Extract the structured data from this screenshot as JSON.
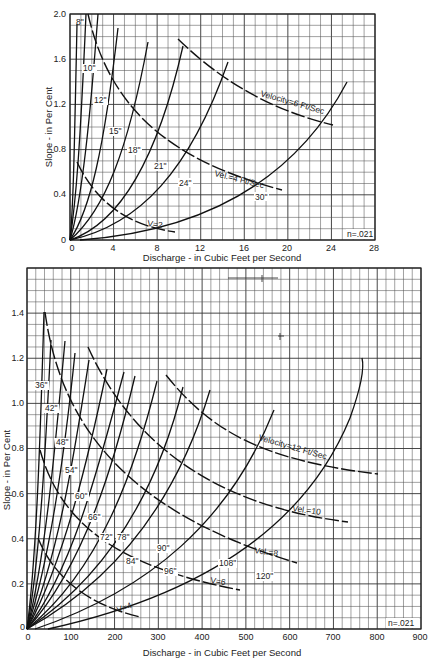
{
  "chart_data": [
    {
      "type": "line",
      "title": "",
      "xlabel": "Discharge - in Cubic Feet per Second",
      "ylabel": "Slope - in Per Cent",
      "xlim": [
        0,
        28
      ],
      "ylim": [
        0,
        2.0
      ],
      "x_ticks": [
        "0",
        "4",
        "8",
        "12",
        "16",
        "20",
        "24",
        "28"
      ],
      "y_ticks": [
        "0",
        "0.4",
        "0.8",
        "1.2",
        "1.6",
        "2.0"
      ],
      "grid": true,
      "annotation": "n=.021",
      "pipe_size_series": [
        {
          "name": "8\"",
          "points": [
            [
              0,
              0
            ],
            [
              0.3,
              0.3
            ],
            [
              0.45,
              0.8
            ],
            [
              0.6,
              1.9
            ]
          ]
        },
        {
          "name": "10\"",
          "points": [
            [
              0,
              0
            ],
            [
              0.5,
              0.3
            ],
            [
              0.9,
              0.8
            ],
            [
              1.2,
              1.3
            ],
            [
              1.4,
              1.7
            ],
            [
              1.5,
              2.0
            ]
          ]
        },
        {
          "name": "12\"",
          "points": [
            [
              0,
              0
            ],
            [
              0.9,
              0.3
            ],
            [
              1.6,
              0.8
            ],
            [
              2.2,
              1.4
            ],
            [
              2.6,
              2.0
            ]
          ]
        },
        {
          "name": "15\"",
          "points": [
            [
              0,
              0
            ],
            [
              1.5,
              0.25
            ],
            [
              2.8,
              0.7
            ],
            [
              3.6,
              1.1
            ],
            [
              4.4,
              1.85
            ]
          ]
        },
        {
          "name": "18\"",
          "points": [
            [
              0,
              0
            ],
            [
              2.5,
              0.25
            ],
            [
              4.6,
              0.7
            ],
            [
              6.0,
              1.2
            ],
            [
              7.2,
              1.75
            ]
          ]
        },
        {
          "name": "21\"",
          "points": [
            [
              0,
              0
            ],
            [
              3.7,
              0.22
            ],
            [
              6.9,
              0.6
            ],
            [
              8.8,
              1.0
            ],
            [
              10.4,
              1.7
            ]
          ]
        },
        {
          "name": "24\"",
          "points": [
            [
              0,
              0
            ],
            [
              5.5,
              0.2
            ],
            [
              9.5,
              0.5
            ],
            [
              12.3,
              0.9
            ],
            [
              13.5,
              1.2
            ],
            [
              14.5,
              1.6
            ]
          ]
        },
        {
          "name": "30\"",
          "points": [
            [
              1.0,
              0
            ],
            [
              8,
              0.06
            ],
            [
              14,
              0.2
            ],
            [
              19,
              0.45
            ],
            [
              22.5,
              0.8
            ],
            [
              24.5,
              1.1
            ],
            [
              25.5,
              1.35
            ]
          ]
        }
      ],
      "velocity_series": [
        {
          "name": "V=2",
          "points": [
            [
              0.6,
              0.7
            ],
            [
              2.5,
              0.33
            ],
            [
              5,
              0.18
            ],
            [
              7.5,
              0.1
            ],
            [
              9.6,
              0.07
            ]
          ]
        },
        {
          "name": "Vel.=4 Ft/Sec",
          "points": [
            [
              1.5,
              2.0
            ],
            [
              3,
              1.4
            ],
            [
              5,
              1.0
            ],
            [
              8,
              0.75
            ],
            [
              11,
              0.6
            ],
            [
              14,
              0.52
            ],
            [
              17,
              0.46
            ],
            [
              19.5,
              0.44
            ]
          ]
        },
        {
          "name": "Velocity=6 Ft/Sec",
          "points": [
            [
              10,
              1.78
            ],
            [
              13,
              1.48
            ],
            [
              16,
              1.3
            ],
            [
              19,
              1.17
            ],
            [
              22,
              1.08
            ],
            [
              24.2,
              1.02
            ]
          ]
        }
      ]
    },
    {
      "type": "line",
      "title": "",
      "xlabel": "Discharge - in Cubic Feet per Second",
      "ylabel": "Slope - in Per Cent",
      "xlim": [
        0,
        900
      ],
      "ylim": [
        0,
        1.6
      ],
      "x_ticks": [
        "0",
        "100",
        "200",
        "300",
        "400",
        "500",
        "600",
        "700",
        "800",
        "900"
      ],
      "y_ticks": [
        "0",
        "0.2",
        "0.4",
        "0.6",
        "0.8",
        "1.0",
        "1.2",
        "1.4"
      ],
      "grid": true,
      "annotation": "n=.021",
      "pipe_size_series": [
        {
          "name": "36\"",
          "points": [
            [
              0,
              0
            ],
            [
              22,
              0.3
            ],
            [
              32,
              0.8
            ],
            [
              38,
              1.4
            ]
          ]
        },
        {
          "name": "42\"",
          "points": [
            [
              0,
              0
            ],
            [
              30,
              0.3
            ],
            [
              48,
              0.8
            ],
            [
              56,
              1.32
            ]
          ]
        },
        {
          "name": "48\"",
          "points": [
            [
              0,
              0
            ],
            [
              45,
              0.3
            ],
            [
              68,
              0.8
            ],
            [
              80,
              1.3
            ]
          ]
        },
        {
          "name": "54\"",
          "points": [
            [
              0,
              0
            ],
            [
              60,
              0.3
            ],
            [
              88,
              0.8
            ],
            [
              104,
              1.22
            ]
          ]
        },
        {
          "name": "60\"",
          "points": [
            [
              0,
              0
            ],
            [
              80,
              0.3
            ],
            [
              115,
              0.8
            ],
            [
              134,
              1.2
            ]
          ]
        },
        {
          "name": "66\"",
          "points": [
            [
              0,
              0
            ],
            [
              100,
              0.3
            ],
            [
              140,
              0.75
            ],
            [
              165,
              1.15
            ]
          ]
        },
        {
          "name": "72\"",
          "points": [
            [
              0,
              0
            ],
            [
              125,
              0.3
            ],
            [
              175,
              0.75
            ],
            [
              205,
              1.13
            ]
          ]
        },
        {
          "name": "78\"",
          "points": [
            [
              0,
              0
            ],
            [
              150,
              0.3
            ],
            [
              210,
              0.72
            ],
            [
              245,
              1.1
            ]
          ]
        },
        {
          "name": "84\"",
          "points": [
            [
              0,
              0
            ],
            [
              180,
              0.3
            ],
            [
              255,
              0.72
            ],
            [
              295,
              1.1
            ]
          ]
        },
        {
          "name": "90\"",
          "points": [
            [
              0,
              0
            ],
            [
              215,
              0.3
            ],
            [
              310,
              0.7
            ],
            [
              355,
              1.07
            ]
          ]
        },
        {
          "name": "96\"",
          "points": [
            [
              0,
              0
            ],
            [
              250,
              0.28
            ],
            [
              370,
              0.68
            ],
            [
              425,
              1.05
            ]
          ]
        },
        {
          "name": "108\"",
          "points": [
            [
              20,
              0
            ],
            [
              300,
              0.2
            ],
            [
              440,
              0.5
            ],
            [
              540,
              0.78
            ],
            [
              600,
              1.0
            ]
          ]
        },
        {
          "name": "120\"",
          "points": [
            [
              50,
              0
            ],
            [
              350,
              0.16
            ],
            [
              550,
              0.36
            ],
            [
              700,
              0.6
            ],
            [
              780,
              0.8
            ],
            [
              815,
              0.95
            ]
          ]
        }
      ],
      "velocity_series": [
        {
          "name": "V=4",
          "points": [
            [
              25,
              0.4
            ],
            [
              80,
              0.26
            ],
            [
              150,
              0.16
            ],
            [
              220,
              0.1
            ],
            [
              265,
              0.08
            ]
          ]
        },
        {
          "name": "V=6",
          "points": [
            [
              28,
              0.85
            ],
            [
              80,
              0.52
            ],
            [
              150,
              0.36
            ],
            [
              250,
              0.26
            ],
            [
              380,
              0.2
            ],
            [
              500,
              0.18
            ]
          ]
        },
        {
          "name": "Vel.=8",
          "points": [
            [
              45,
              1.2
            ],
            [
              110,
              0.82
            ],
            [
              200,
              0.6
            ],
            [
              300,
              0.48
            ],
            [
              450,
              0.38
            ],
            [
              600,
              0.33
            ],
            [
              630,
              0.32
            ]
          ]
        },
        {
          "name": "Vel.=10",
          "points": [
            [
              150,
              1.25
            ],
            [
              250,
              0.96
            ],
            [
              350,
              0.75
            ],
            [
              450,
              0.62
            ],
            [
              550,
              0.55
            ],
            [
              650,
              0.5
            ],
            [
              740,
              0.48
            ]
          ]
        },
        {
          "name": "Velocity=12 Ft/Sec",
          "points": [
            [
              320,
              1.13
            ],
            [
              420,
              0.95
            ],
            [
              500,
              0.86
            ],
            [
              600,
              0.78
            ],
            [
              700,
              0.73
            ],
            [
              800,
              0.7
            ]
          ]
        }
      ]
    }
  ],
  "top_chart": {
    "y_axis_title": "Slope - in Per Cent",
    "x_axis_title": "Discharge - in Cubic Feet per Second",
    "y_ticks": [
      "2.0",
      "1.6",
      "1.2",
      "0.8",
      "0.4",
      "0"
    ],
    "x_ticks": [
      "0",
      "4",
      "8",
      "12",
      "16",
      "20",
      "24",
      "28"
    ],
    "note": "n=.021",
    "labels": {
      "p8": "8\"",
      "p10": "10\"",
      "p12": "12\"",
      "p15": "15\"",
      "p18": "18\"",
      "p21": "21\"",
      "p24": "24\"",
      "p30": "30\"",
      "v2": "V=2",
      "v4": "Vel.=4 Ft/Sec",
      "v6": "Velocity=6 Ft/Sec"
    }
  },
  "bottom_chart": {
    "y_axis_title": "Slope - in Per Cent",
    "x_axis_title": "Discharge - in Cubic Feet per Second",
    "y_ticks": [
      "1.4",
      "1.2",
      "1.0",
      "0.8",
      "0.6",
      "0.4",
      "0.2",
      "0"
    ],
    "x_ticks": [
      "0",
      "100",
      "200",
      "300",
      "400",
      "500",
      "600",
      "700",
      "800",
      "900"
    ],
    "note": "n=.021",
    "labels": {
      "p36": "36\"",
      "p42": "42\"",
      "p48": "48\"",
      "p54": "54\"",
      "p60": "60\"",
      "p66": "66\"",
      "p72": "72\"",
      "p78": "78\"",
      "p84": "84\"",
      "p90": "90\"",
      "p96": "96\"",
      "p108": "108\"",
      "p120": "120\"",
      "v4": "V=4",
      "v6": "V=6",
      "v8": "Vel.=8",
      "v10": "Vel.=10",
      "v12": "Velocity=12 Ft/Sec"
    }
  }
}
